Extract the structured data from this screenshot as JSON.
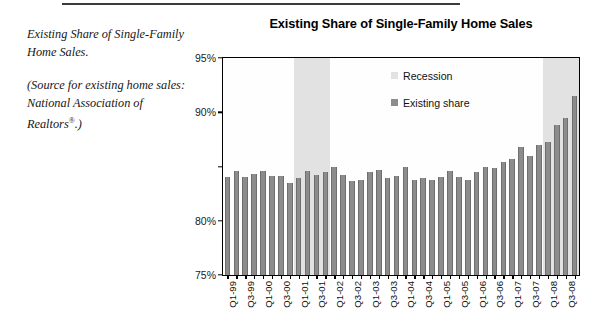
{
  "caption": {
    "heading": "Existing Share of Single-Family Home Sales.",
    "source_prefix": "(Source for existing home sales: National Association of Realtors",
    "source_mark": "®",
    "source_suffix": ".)"
  },
  "legend": {
    "position": "top-right",
    "items": [
      {
        "label": "Recession",
        "color": "#e2e2e2",
        "name": "recession"
      },
      {
        "label": "Existing share",
        "color": "#8c8c8c",
        "name": "existing-share"
      }
    ]
  },
  "colors": {
    "bar": "#8c8c8c",
    "recession_band": "#e2e2e2",
    "axis": "#000000",
    "text": "#111111"
  },
  "chart_data": {
    "type": "bar",
    "title": "Existing Share of Single-Family Home Sales",
    "xlabel": "",
    "ylabel": "",
    "ylim": [
      75,
      95
    ],
    "yticks": [
      75,
      80,
      85,
      90,
      95
    ],
    "ytick_labels": [
      "75%",
      "80%",
      "",
      "90%",
      "95%"
    ],
    "grid": false,
    "legend_position": "top-right",
    "categories": [
      "Q1-99",
      "Q2-99",
      "Q3-99",
      "Q4-99",
      "Q1-00",
      "Q2-00",
      "Q3-00",
      "Q4-00",
      "Q1-01",
      "Q2-01",
      "Q3-01",
      "Q4-01",
      "Q1-02",
      "Q2-02",
      "Q3-02",
      "Q4-02",
      "Q1-03",
      "Q2-03",
      "Q3-03",
      "Q4-03",
      "Q1-04",
      "Q2-04",
      "Q3-04",
      "Q4-04",
      "Q1-05",
      "Q2-05",
      "Q3-05",
      "Q4-05",
      "Q1-06",
      "Q2-06",
      "Q3-06",
      "Q4-06",
      "Q1-07",
      "Q2-07",
      "Q3-07",
      "Q4-07",
      "Q1-08",
      "Q2-08",
      "Q3-08",
      "Q4-08"
    ],
    "xtick_labels_shown": [
      "Q1-99",
      "Q3-99",
      "Q1-00",
      "Q3-00",
      "Q1-01",
      "Q3-01",
      "Q1-02",
      "Q3-02",
      "Q1-03",
      "Q3-03",
      "Q1-04",
      "Q3-04",
      "Q1-05",
      "Q3-05",
      "Q1-06",
      "Q3-06",
      "Q1-07",
      "Q3-07",
      "Q1-08",
      "Q3-08"
    ],
    "series": [
      {
        "name": "Existing share",
        "color": "#8c8c8c",
        "unit": "%",
        "values": [
          84.0,
          84.6,
          84.0,
          84.3,
          84.6,
          84.1,
          84.1,
          83.5,
          83.9,
          84.6,
          84.2,
          84.5,
          85.0,
          84.2,
          83.7,
          83.8,
          84.5,
          84.7,
          83.9,
          84.1,
          85.0,
          83.8,
          83.9,
          83.8,
          84.0,
          84.6,
          84.0,
          83.8,
          84.5,
          85.0,
          84.9,
          85.4,
          85.7,
          86.8,
          86.0,
          87.0,
          87.3,
          88.8,
          89.5,
          91.5
        ]
      }
    ],
    "recessions": [
      {
        "label": "2001 recession",
        "start_category": "Q1-01",
        "end_category": "Q4-01"
      },
      {
        "label": "2007-2008 recession",
        "start_category": "Q1-08",
        "end_category": "Q4-08"
      }
    ]
  }
}
